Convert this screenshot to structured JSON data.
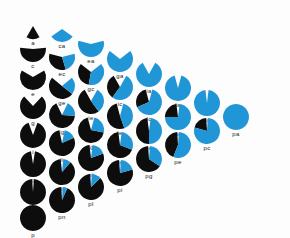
{
  "figure": {
    "title": "",
    "background_color": "#fdfdfd",
    "black_color": "#0d0d0d",
    "blue_color": "#2196d6",
    "gap_color": "#fdfdfd",
    "label_color": "#1a1a1a",
    "radius": 13,
    "column_spacing": 29,
    "row_spacing": 29,
    "origin_x": 33,
    "origin_y": 26
  },
  "chart_data": {
    "type": "pie",
    "title": "",
    "xlabel": "",
    "ylabel": "",
    "legend": [
      {
        "name": "black-sector",
        "color": "#0d0d0d"
      },
      {
        "name": "blue-sector",
        "color": "#2196d6"
      },
      {
        "name": "gap",
        "color": "#fdfdfd"
      }
    ],
    "columns": [
      {
        "index": 1,
        "x": 33,
        "nodes": [
          {
            "label": "a",
            "row": 0,
            "x": 33,
            "y": 26,
            "gap_deg": 300,
            "blue_frac": 0.0,
            "radius": 13
          },
          {
            "label": "c",
            "row": 1,
            "x": 33,
            "y": 49,
            "gap_deg": 170,
            "blue_frac": 0.0,
            "radius": 13
          },
          {
            "label": "e",
            "row": 2,
            "x": 33,
            "y": 77,
            "gap_deg": 120,
            "blue_frac": 0.0,
            "radius": 13
          },
          {
            "label": "g",
            "row": 3,
            "x": 33,
            "y": 106,
            "gap_deg": 86,
            "blue_frac": 0.0,
            "radius": 13
          },
          {
            "label": "i",
            "row": 4,
            "x": 33,
            "y": 135,
            "gap_deg": 40,
            "blue_frac": 0.0,
            "radius": 13
          },
          {
            "label": "l",
            "row": 5,
            "x": 33,
            "y": 164,
            "gap_deg": 18,
            "blue_frac": 0.0,
            "radius": 13
          },
          {
            "label": "n",
            "row": 6,
            "x": 33,
            "y": 192,
            "gap_deg": 8,
            "blue_frac": 0.0,
            "radius": 13
          },
          {
            "label": "p",
            "row": 7,
            "x": 33,
            "y": 218,
            "gap_deg": 0,
            "blue_frac": 0.0,
            "radius": 13
          }
        ]
      },
      {
        "index": 2,
        "x": 62,
        "nodes": [
          {
            "label": "ca",
            "row": 0,
            "x": 62,
            "y": 29,
            "gap_deg": 250,
            "blue_frac": 1.0,
            "radius": 13
          },
          {
            "label": "ec",
            "row": 1,
            "x": 62,
            "y": 57,
            "gap_deg": 150,
            "blue_frac": 0.42,
            "radius": 13
          },
          {
            "label": "ge",
            "row": 2,
            "x": 62,
            "y": 86,
            "gap_deg": 100,
            "blue_frac": 0.3,
            "radius": 13
          },
          {
            "label": "ig",
            "row": 3,
            "x": 62,
            "y": 115,
            "gap_deg": 52,
            "blue_frac": 0.22,
            "radius": 13
          },
          {
            "label": "li",
            "row": 4,
            "x": 62,
            "y": 143,
            "gap_deg": 24,
            "blue_frac": 0.16,
            "radius": 13
          },
          {
            "label": "nl",
            "row": 5,
            "x": 62,
            "y": 172,
            "gap_deg": 12,
            "blue_frac": 0.1,
            "radius": 13
          },
          {
            "label": "pn",
            "row": 6,
            "x": 62,
            "y": 200,
            "gap_deg": 6,
            "blue_frac": 0.06,
            "radius": 13
          }
        ]
      },
      {
        "index": 3,
        "x": 91,
        "nodes": [
          {
            "label": "ea",
            "row": 0,
            "x": 91,
            "y": 44,
            "gap_deg": 150,
            "blue_frac": 1.0,
            "radius": 13
          },
          {
            "label": "gc",
            "row": 1,
            "x": 91,
            "y": 72,
            "gap_deg": 104,
            "blue_frac": 0.54,
            "radius": 13
          },
          {
            "label": "ie",
            "row": 2,
            "x": 91,
            "y": 101,
            "gap_deg": 58,
            "blue_frac": 0.38,
            "radius": 13
          },
          {
            "label": "lg",
            "row": 3,
            "x": 91,
            "y": 130,
            "gap_deg": 30,
            "blue_frac": 0.26,
            "radius": 13
          },
          {
            "label": "ni",
            "row": 4,
            "x": 91,
            "y": 158,
            "gap_deg": 14,
            "blue_frac": 0.18,
            "radius": 13
          },
          {
            "label": "pl",
            "row": 5,
            "x": 91,
            "y": 187,
            "gap_deg": 7,
            "blue_frac": 0.12,
            "radius": 13
          }
        ]
      },
      {
        "index": 4,
        "x": 120,
        "nodes": [
          {
            "label": "ga",
            "row": 0,
            "x": 120,
            "y": 59,
            "gap_deg": 104,
            "blue_frac": 1.0,
            "radius": 13
          },
          {
            "label": "ic",
            "row": 1,
            "x": 120,
            "y": 87,
            "gap_deg": 58,
            "blue_frac": 0.62,
            "radius": 13
          },
          {
            "label": "le",
            "row": 2,
            "x": 120,
            "y": 116,
            "gap_deg": 30,
            "blue_frac": 0.44,
            "radius": 13
          },
          {
            "label": "ng",
            "row": 3,
            "x": 120,
            "y": 145,
            "gap_deg": 15,
            "blue_frac": 0.3,
            "radius": 13
          },
          {
            "label": "pi",
            "row": 4,
            "x": 120,
            "y": 173,
            "gap_deg": 8,
            "blue_frac": 0.2,
            "radius": 13
          }
        ]
      },
      {
        "index": 5,
        "x": 149,
        "nodes": [
          {
            "label": "ia",
            "row": 0,
            "x": 149,
            "y": 74,
            "gap_deg": 58,
            "blue_frac": 1.0,
            "radius": 13
          },
          {
            "label": "lc",
            "row": 1,
            "x": 149,
            "y": 102,
            "gap_deg": 30,
            "blue_frac": 0.7,
            "radius": 13
          },
          {
            "label": "ne",
            "row": 2,
            "x": 149,
            "y": 131,
            "gap_deg": 15,
            "blue_frac": 0.5,
            "radius": 13
          },
          {
            "label": "pg",
            "row": 3,
            "x": 149,
            "y": 159,
            "gap_deg": 8,
            "blue_frac": 0.34,
            "radius": 13
          }
        ]
      },
      {
        "index": 6,
        "x": 178,
        "nodes": [
          {
            "label": "la",
            "row": 0,
            "x": 178,
            "y": 88,
            "gap_deg": 30,
            "blue_frac": 1.0,
            "radius": 13
          },
          {
            "label": "nc",
            "row": 1,
            "x": 178,
            "y": 117,
            "gap_deg": 14,
            "blue_frac": 0.76,
            "radius": 13
          },
          {
            "label": "pe",
            "row": 2,
            "x": 178,
            "y": 145,
            "gap_deg": 7,
            "blue_frac": 0.56,
            "radius": 13
          }
        ]
      },
      {
        "index": 7,
        "x": 207,
        "nodes": [
          {
            "label": "na",
            "row": 0,
            "x": 207,
            "y": 103,
            "gap_deg": 14,
            "blue_frac": 1.0,
            "radius": 13
          },
          {
            "label": "pc",
            "row": 1,
            "x": 207,
            "y": 131,
            "gap_deg": 7,
            "blue_frac": 0.8,
            "radius": 13
          }
        ]
      },
      {
        "index": 8,
        "x": 236,
        "nodes": [
          {
            "label": "pa",
            "row": 0,
            "x": 236,
            "y": 117,
            "gap_deg": 0,
            "blue_frac": 1.0,
            "radius": 13
          }
        ]
      }
    ]
  }
}
